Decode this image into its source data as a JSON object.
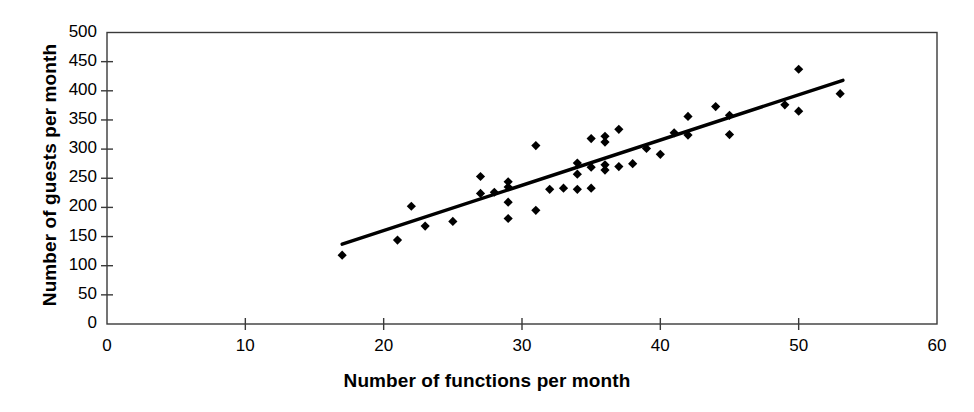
{
  "chart_data": {
    "type": "scatter",
    "title": "",
    "xlabel": "Number of functions per month",
    "ylabel": "Number of guests per month",
    "xlim": [
      0,
      60
    ],
    "ylim": [
      0,
      500
    ],
    "xticks": [
      0,
      10,
      20,
      30,
      40,
      50,
      60
    ],
    "yticks": [
      0,
      50,
      100,
      150,
      200,
      250,
      300,
      350,
      400,
      450,
      500
    ],
    "grid": false,
    "legend": null,
    "marker": "diamond",
    "marker_color": "#000000",
    "line_color": "#000000",
    "points": [
      {
        "x": 17,
        "y": 118
      },
      {
        "x": 21,
        "y": 144
      },
      {
        "x": 22,
        "y": 202
      },
      {
        "x": 23,
        "y": 168
      },
      {
        "x": 25,
        "y": 176
      },
      {
        "x": 27,
        "y": 253
      },
      {
        "x": 27,
        "y": 224
      },
      {
        "x": 28,
        "y": 226
      },
      {
        "x": 29,
        "y": 244
      },
      {
        "x": 29,
        "y": 235
      },
      {
        "x": 29,
        "y": 209
      },
      {
        "x": 29,
        "y": 181
      },
      {
        "x": 31,
        "y": 306
      },
      {
        "x": 31,
        "y": 195
      },
      {
        "x": 32,
        "y": 231
      },
      {
        "x": 33,
        "y": 233
      },
      {
        "x": 34,
        "y": 276
      },
      {
        "x": 34,
        "y": 257
      },
      {
        "x": 34,
        "y": 231
      },
      {
        "x": 35,
        "y": 318
      },
      {
        "x": 35,
        "y": 269
      },
      {
        "x": 35,
        "y": 233
      },
      {
        "x": 36,
        "y": 322
      },
      {
        "x": 36,
        "y": 312
      },
      {
        "x": 36,
        "y": 273
      },
      {
        "x": 36,
        "y": 264
      },
      {
        "x": 37,
        "y": 334
      },
      {
        "x": 37,
        "y": 270
      },
      {
        "x": 38,
        "y": 275
      },
      {
        "x": 39,
        "y": 301
      },
      {
        "x": 40,
        "y": 291
      },
      {
        "x": 41,
        "y": 328
      },
      {
        "x": 42,
        "y": 356
      },
      {
        "x": 42,
        "y": 324
      },
      {
        "x": 44,
        "y": 373
      },
      {
        "x": 45,
        "y": 358
      },
      {
        "x": 45,
        "y": 325
      },
      {
        "x": 49,
        "y": 376
      },
      {
        "x": 50,
        "y": 437
      },
      {
        "x": 50,
        "y": 365
      },
      {
        "x": 53,
        "y": 395
      }
    ],
    "trend_line": {
      "x1": 17,
      "y1": 137,
      "x2": 53.2,
      "y2": 418
    }
  }
}
